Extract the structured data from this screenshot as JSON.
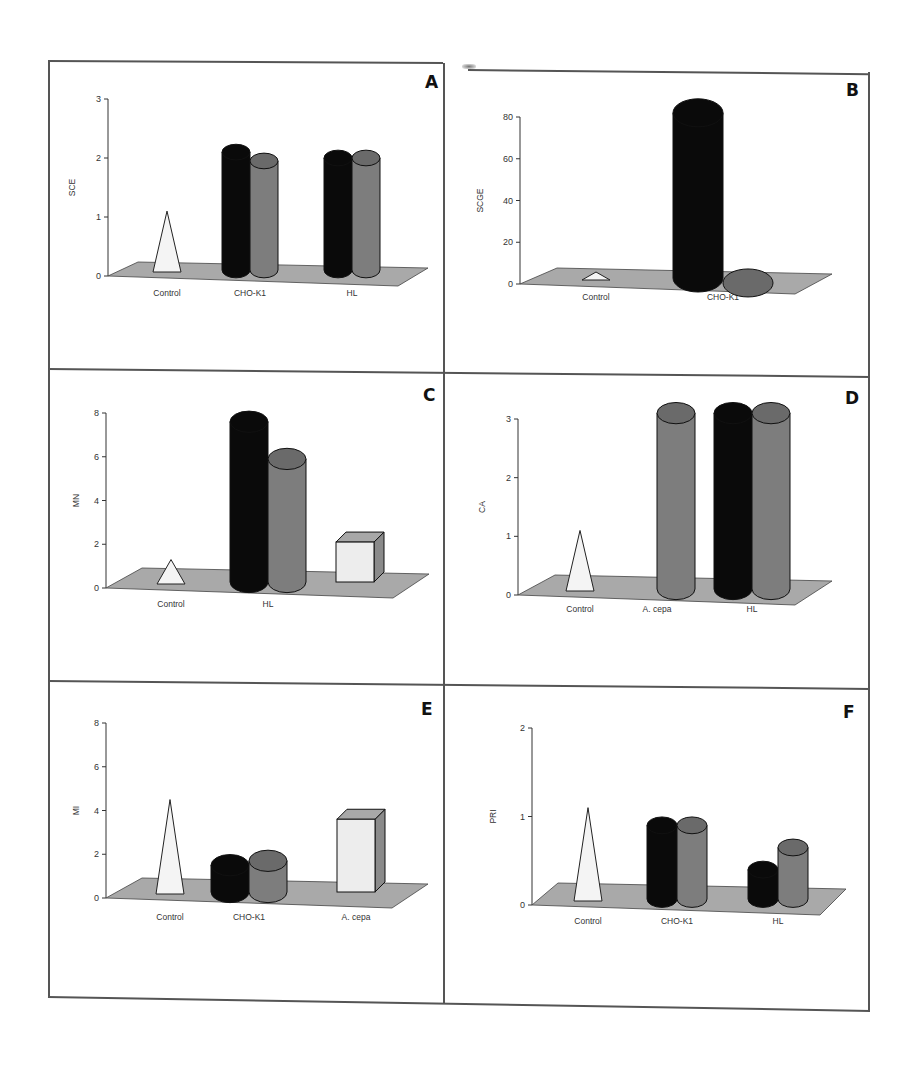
{
  "figure": {
    "panels": [
      "A",
      "B",
      "C",
      "D",
      "E",
      "F"
    ]
  },
  "colors": {
    "black_series": "#0a0a0a",
    "gray_series": "#7d7d7d",
    "gray_top": "#6a6a6a",
    "control_fill": "#f4f4f4",
    "box_fill": "#ededed",
    "floor": "#a9a9a9"
  },
  "chart_data": [
    {
      "panel": "A",
      "type": "bar",
      "style": "3d",
      "title": "",
      "ylabel": "SCE",
      "xlabel": "",
      "ylim": [
        0,
        3
      ],
      "yticks": [
        0,
        1,
        2,
        3
      ],
      "categories": [
        "Control",
        "CHO-K1",
        "HL"
      ],
      "series": [
        {
          "name": "Control",
          "shape": "cone",
          "color": "white",
          "values": [
            1.1,
            null,
            null
          ]
        },
        {
          "name": "black cylinder",
          "shape": "cylinder",
          "color": "black",
          "values": [
            null,
            2.1,
            2.0
          ]
        },
        {
          "name": "gray cylinder",
          "shape": "cylinder",
          "color": "gray",
          "values": [
            null,
            1.95,
            2.0
          ]
        }
      ]
    },
    {
      "panel": "B",
      "type": "bar",
      "style": "3d",
      "title": "",
      "ylabel": "SCGE",
      "xlabel": "",
      "ylim": [
        0,
        80
      ],
      "yticks": [
        0,
        20,
        40,
        60,
        80
      ],
      "categories": [
        "Control",
        "CHO-K1"
      ],
      "series": [
        {
          "name": "Control",
          "shape": "cone",
          "color": "white",
          "values": [
            1,
            null
          ]
        },
        {
          "name": "black cylinder",
          "shape": "cylinder",
          "color": "black",
          "values": [
            null,
            82
          ]
        },
        {
          "name": "gray cylinder",
          "shape": "cylinder",
          "color": "gray",
          "values": [
            null,
            0.5
          ]
        }
      ]
    },
    {
      "panel": "C",
      "type": "bar",
      "style": "3d",
      "title": "",
      "ylabel": "MN",
      "xlabel": "",
      "ylim": [
        0,
        8
      ],
      "yticks": [
        0,
        2,
        4,
        6,
        8
      ],
      "categories": [
        "Control",
        "HL",
        ""
      ],
      "series": [
        {
          "name": "Control",
          "shape": "cone",
          "color": "white",
          "values": [
            1.3,
            null,
            null
          ]
        },
        {
          "name": "black cylinder",
          "shape": "cylinder",
          "color": "black",
          "values": [
            null,
            7.6,
            null
          ]
        },
        {
          "name": "gray cylinder",
          "shape": "cylinder",
          "color": "gray",
          "values": [
            null,
            5.9,
            null
          ]
        },
        {
          "name": "box",
          "shape": "box",
          "color": "light",
          "values": [
            null,
            null,
            2.1
          ]
        }
      ]
    },
    {
      "panel": "D",
      "type": "bar",
      "style": "3d",
      "title": "",
      "ylabel": "CA",
      "xlabel": "",
      "ylim": [
        0,
        3
      ],
      "yticks": [
        0,
        1,
        2,
        3
      ],
      "categories": [
        "Control",
        "A. cepa",
        "HL"
      ],
      "series": [
        {
          "name": "Control",
          "shape": "cone",
          "color": "white",
          "values": [
            1.1,
            null,
            null
          ]
        },
        {
          "name": "black cylinder",
          "shape": "cylinder",
          "color": "black",
          "values": [
            null,
            null,
            3.1
          ]
        },
        {
          "name": "gray cylinder",
          "shape": "cylinder",
          "color": "gray",
          "values": [
            null,
            3.1,
            3.1
          ]
        }
      ]
    },
    {
      "panel": "E",
      "type": "bar",
      "style": "3d",
      "title": "",
      "ylabel": "MI",
      "xlabel": "",
      "ylim": [
        0,
        8
      ],
      "yticks": [
        0,
        2,
        4,
        6,
        8
      ],
      "categories": [
        "Control",
        "CHO-K1",
        "A. cepa"
      ],
      "series": [
        {
          "name": "Control",
          "shape": "cone",
          "color": "white",
          "values": [
            4.5,
            null,
            null
          ]
        },
        {
          "name": "black cylinder",
          "shape": "cylinder",
          "color": "black",
          "values": [
            null,
            1.5,
            null
          ]
        },
        {
          "name": "gray cylinder",
          "shape": "cylinder",
          "color": "gray",
          "values": [
            null,
            1.7,
            null
          ]
        },
        {
          "name": "box",
          "shape": "box",
          "color": "light",
          "values": [
            null,
            null,
            3.6
          ]
        }
      ]
    },
    {
      "panel": "F",
      "type": "bar",
      "style": "3d",
      "title": "",
      "ylabel": "PRI",
      "xlabel": "",
      "ylim": [
        0,
        2
      ],
      "yticks": [
        0,
        1,
        2
      ],
      "categories": [
        "Control",
        "CHO-K1",
        "HL"
      ],
      "series": [
        {
          "name": "Control",
          "shape": "cone",
          "color": "white",
          "values": [
            1.1,
            null,
            null
          ]
        },
        {
          "name": "black cylinder",
          "shape": "cylinder",
          "color": "black",
          "values": [
            null,
            0.9,
            0.4
          ]
        },
        {
          "name": "gray cylinder",
          "shape": "cylinder",
          "color": "gray",
          "values": [
            null,
            0.9,
            0.65
          ]
        }
      ]
    }
  ]
}
